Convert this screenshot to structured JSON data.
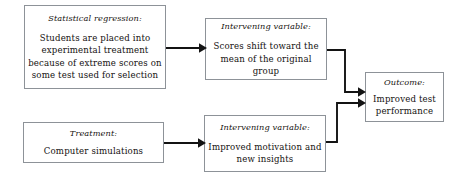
{
  "diagram": {
    "stroke_color": "#131313",
    "box_border_color": "#8d9298",
    "background_color": "#ffffff",
    "boxes": [
      {
        "id": "statistical-regression",
        "heading": "Statistical regression:",
        "body": "Students are placed into experimental treatment because of extreme scores on some test used for selection"
      },
      {
        "id": "intervening-regression",
        "heading": "Intervening variable:",
        "body": "Scores shift toward the mean of the original group"
      },
      {
        "id": "treatment",
        "heading": "Treatment:",
        "body": "Computer simulations"
      },
      {
        "id": "intervening-treatment",
        "heading": "Intervening variable:",
        "body": "Improved motivation and new insights"
      },
      {
        "id": "outcome",
        "heading": "Outcome:",
        "body": "Improved test performance"
      }
    ],
    "connectors": [
      {
        "id": "regression-to-intervening",
        "from": "statistical-regression",
        "to": "intervening-regression",
        "style": "straight-arrow"
      },
      {
        "id": "intervening-regression-to-outcome",
        "from": "intervening-regression",
        "to": "outcome",
        "style": "elbow-arrow"
      },
      {
        "id": "treatment-to-intervening",
        "from": "treatment",
        "to": "intervening-treatment",
        "style": "straight-arrow"
      },
      {
        "id": "intervening-treatment-to-outcome",
        "from": "intervening-treatment",
        "to": "outcome",
        "style": "elbow-arrow"
      }
    ]
  }
}
